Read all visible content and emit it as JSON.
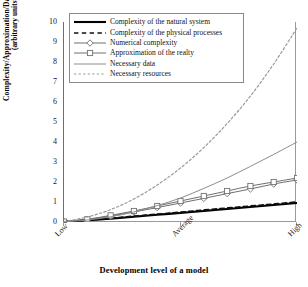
{
  "chart_data": {
    "type": "line",
    "title": "",
    "xlabel": "Development level of a model",
    "ylabel": "Complexity/Approximation/Data & Resources (arbitrary units)",
    "ylabel_line1": "Complexity/Approximation/Data & Resources",
    "ylabel_line2": "(arbitrary units)",
    "ylim": [
      0,
      10
    ],
    "yticks": [
      0,
      1,
      2,
      3,
      4,
      5,
      6,
      7,
      8,
      9,
      10
    ],
    "xlim": [
      0,
      10
    ],
    "xticks": [
      0,
      5,
      10
    ],
    "xtick_labels": [
      "Low",
      "Average",
      "High"
    ],
    "grid": false,
    "legend_position": "upper left inside",
    "x": [
      0,
      1,
      2,
      3,
      4,
      5,
      6,
      7,
      8,
      9,
      10
    ],
    "series": [
      {
        "name": "Complexity of the natural system",
        "style": "solid",
        "color": "#000000",
        "width": 2.1,
        "marker": "none",
        "values": [
          0.02,
          0.09,
          0.17,
          0.26,
          0.36,
          0.45,
          0.55,
          0.65,
          0.75,
          0.85,
          0.95
        ]
      },
      {
        "name": "Complexity of the physical processes",
        "style": "dashed",
        "color": "#101010",
        "width": 1.7,
        "marker": "none",
        "values": [
          0.02,
          0.1,
          0.19,
          0.29,
          0.39,
          0.49,
          0.6,
          0.7,
          0.8,
          0.9,
          1.0
        ]
      },
      {
        "name": "Numerical complexity",
        "style": "solid",
        "color": "#707070",
        "width": 1.0,
        "marker": "diamond",
        "values": [
          0.02,
          0.12,
          0.3,
          0.5,
          0.72,
          0.95,
          1.18,
          1.42,
          1.65,
          1.9,
          2.1
        ]
      },
      {
        "name": "Approximation of the realty",
        "style": "solid",
        "color": "#707070",
        "width": 1.0,
        "marker": "square",
        "values": [
          0.02,
          0.14,
          0.33,
          0.55,
          0.8,
          1.05,
          1.3,
          1.55,
          1.8,
          2.0,
          2.2
        ]
      },
      {
        "name": "Necessary data",
        "style": "solid",
        "color": "#8c8c8c",
        "width": 1.0,
        "marker": "none",
        "values": [
          0.02,
          0.1,
          0.26,
          0.5,
          0.82,
          1.2,
          1.68,
          2.2,
          2.78,
          3.38,
          4.0
        ]
      },
      {
        "name": "Necessary resources",
        "style": "dotted",
        "color": "#9a9a9a",
        "width": 1.2,
        "marker": "none",
        "values": [
          0.02,
          0.25,
          0.62,
          1.15,
          1.85,
          2.7,
          3.72,
          4.92,
          6.3,
          7.9,
          9.7
        ]
      }
    ]
  },
  "legend": {
    "items": [
      {
        "label": "Complexity of the natural system",
        "key": "line-solid-thick-black"
      },
      {
        "label": "Complexity of the physical processes",
        "key": "line-dashed-black"
      },
      {
        "label": "Numerical complexity",
        "key": "line-diamond-marker-gray"
      },
      {
        "label": "Approximation of the realty",
        "key": "line-square-marker-gray"
      },
      {
        "label": "Necessary data",
        "key": "line-solid-gray"
      },
      {
        "label": "Necessary resources",
        "key": "line-dotted-gray"
      }
    ]
  },
  "axes": {
    "y_tick_labels": [
      "10",
      "9",
      "8",
      "7",
      "6",
      "5",
      "4",
      "3",
      "2",
      "1",
      "0"
    ],
    "x_tick_labels": [
      "Low",
      "Average",
      "High"
    ],
    "x_title": "Development level of a model",
    "y_title_line1": "Complexity/Approximation/Data & Resources",
    "y_title_line2": "(arbitrary units)"
  }
}
